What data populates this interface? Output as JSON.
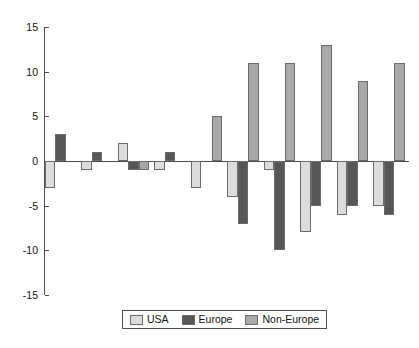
{
  "chart_data": {
    "type": "bar",
    "title": "",
    "subtitle": "",
    "xlabel": "",
    "ylabel": "",
    "ylim": [
      -15,
      15
    ],
    "yticks": [
      15,
      10,
      5,
      0,
      -5,
      -10,
      -15
    ],
    "ytick_labels": [
      "15",
      "10",
      "5",
      "0",
      "-5",
      "-10",
      "-15"
    ],
    "xticks": [],
    "xtick_labels": [],
    "grid": false,
    "legend_position": "bottom-center",
    "categories": [
      "1",
      "2",
      "3",
      "4",
      "5",
      "6",
      "7",
      "8",
      "9",
      "10"
    ],
    "series": [
      {
        "name": "USA",
        "color": "#dcdcdc",
        "values": [
          -3,
          -1,
          2,
          -1,
          -3,
          -4,
          -1,
          -8,
          -6,
          -5
        ]
      },
      {
        "name": "Europe",
        "color": "#575757",
        "values": [
          3,
          1,
          -1,
          1,
          0,
          -7,
          -10,
          -5,
          -5,
          -6
        ]
      },
      {
        "name": "Non-Europe",
        "color": "#a8a8a8",
        "values": [
          0,
          0,
          -1,
          0,
          5,
          11,
          11,
          13,
          9,
          11
        ]
      }
    ]
  },
  "legend": {
    "entries": [
      {
        "label": "USA",
        "swatch_name": "legend-swatch-usa"
      },
      {
        "label": "Europe",
        "swatch_name": "legend-swatch-europe"
      },
      {
        "label": "Non-Europe",
        "swatch_name": "legend-swatch-non-europe"
      }
    ]
  },
  "axes": {
    "y_tick_labels": [
      "15",
      "10",
      "5",
      "0",
      "-5",
      "-10",
      "-15"
    ]
  },
  "colors": {
    "usa": "#dcdcdc",
    "europe": "#575757",
    "non_europe": "#a8a8a8",
    "axis": "#4d4d4d",
    "bar_edge": "#6b6b6b",
    "background": "#ffffff"
  }
}
